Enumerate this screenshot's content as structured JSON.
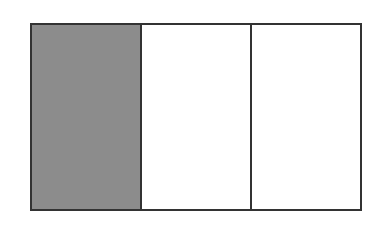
{
  "diagram": {
    "type": "fraction-rectangle",
    "total_parts": 3,
    "shaded_parts": 1,
    "fraction": "1/3",
    "parts": [
      {
        "index": 0,
        "shaded": true
      },
      {
        "index": 1,
        "shaded": false
      },
      {
        "index": 2,
        "shaded": false
      }
    ],
    "colors": {
      "shaded": "#8c8c8c",
      "empty": "#ffffff",
      "border": "#333333"
    }
  }
}
